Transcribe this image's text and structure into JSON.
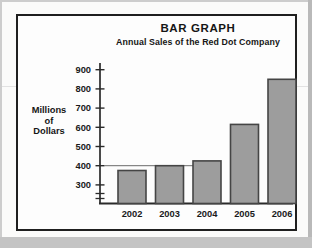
{
  "figure": {
    "title": "BAR GRAPH",
    "subtitle": "Annual Sales of the Red Dot Company",
    "y_axis_title_line1": "Millions",
    "y_axis_title_line2": "of",
    "y_axis_title_line3": "Dollars"
  },
  "chart_data": {
    "type": "bar",
    "title": "BAR GRAPH",
    "subtitle": "Annual Sales of the Red Dot Company",
    "ylabel": "Millions of Dollars",
    "xlabel": "",
    "categories": [
      "2002",
      "2003",
      "2004",
      "2005",
      "2006"
    ],
    "values": [
      375,
      400,
      425,
      615,
      850
    ],
    "y_ticks": [
      900,
      800,
      700,
      600,
      500,
      400,
      300
    ],
    "ylim": [
      300,
      950
    ],
    "axis_break_below_min": true,
    "reference_line_value": 400,
    "grid": false,
    "legend": false,
    "bar_fill_color": "#9d9d9d",
    "bar_border_color": "#454545",
    "axis_color": "#2a2a2a",
    "text_color": "#1a1a1a"
  }
}
